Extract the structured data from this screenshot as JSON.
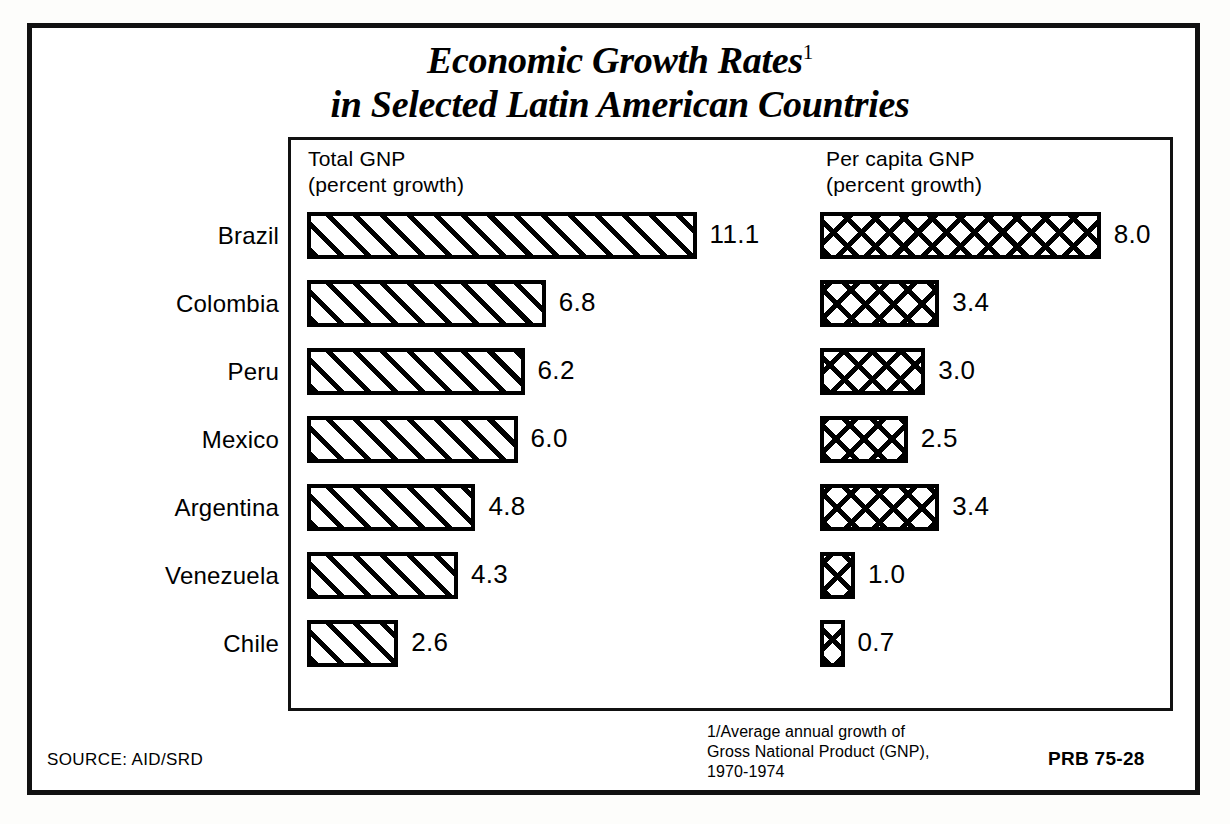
{
  "title": {
    "line1": "Economic Growth Rates",
    "footnote_marker": "1",
    "line2": "in Selected Latin American Countries"
  },
  "columns": {
    "left_header": "Total  GNP\n(percent  growth)",
    "right_header": "Per capita GNP\n(percent growth)"
  },
  "footer": {
    "footnote": "1/Average annual growth of\nGross National Product (GNP),\n1970-1974",
    "source": "SOURCE: AID/SRD",
    "code": "PRB 75-28"
  },
  "rows": [
    {
      "country": "Brazil",
      "total_gnp": "11.1",
      "per_capita_gnp": "8.0"
    },
    {
      "country": "Colombia",
      "total_gnp": "6.8",
      "per_capita_gnp": "3.4"
    },
    {
      "country": "Peru",
      "total_gnp": "6.2",
      "per_capita_gnp": "3.0"
    },
    {
      "country": "Mexico",
      "total_gnp": "6.0",
      "per_capita_gnp": "2.5"
    },
    {
      "country": "Argentina",
      "total_gnp": "4.8",
      "per_capita_gnp": "3.4"
    },
    {
      "country": "Venezuela",
      "total_gnp": "4.3",
      "per_capita_gnp": "1.0"
    },
    {
      "country": "Chile",
      "total_gnp": "2.6",
      "per_capita_gnp": "0.7"
    }
  ],
  "chart_data": {
    "type": "bar",
    "subtitle": "Average annual growth of Gross National Product (GNP), 1970-1974",
    "orientation": "horizontal",
    "categories": [
      "Brazil",
      "Colombia",
      "Peru",
      "Mexico",
      "Argentina",
      "Venezuela",
      "Chile"
    ],
    "series": [
      {
        "name": "Total GNP (percent growth)",
        "values": [
          11.1,
          6.8,
          6.2,
          6.0,
          4.8,
          4.3,
          2.6
        ],
        "pattern": "diagonal-hatch"
      },
      {
        "name": "Per capita GNP (percent growth)",
        "values": [
          8.0,
          3.4,
          3.0,
          2.5,
          3.4,
          1.0,
          0.7
        ],
        "pattern": "cross-hatch"
      }
    ],
    "xlabel": "percent growth",
    "ylabel": "",
    "xlim": [
      0,
      11.1
    ],
    "grid": false,
    "legend": "column-headers",
    "value_labels": true,
    "colors": {
      "bar_outline": "#000000",
      "bar_fill": "#ffffff",
      "background": "#ffffff"
    }
  },
  "layout": {
    "left_bar_origin_px": 307,
    "right_bar_origin_px": 820,
    "px_per_unit": 35.1,
    "row_pitch_px": 68,
    "bar_height_px": 47,
    "first_row_top_px": 212
  }
}
